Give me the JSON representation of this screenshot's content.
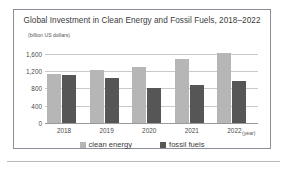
{
  "chart_data": {
    "type": "bar",
    "title": "Global Investment in Clean Energy and Fossil Fuels, 2018–2022",
    "xlabel": "(year)",
    "ylabel": "(billion US dollars)",
    "categories": [
      "2018",
      "2019",
      "2020",
      "2021",
      "2022"
    ],
    "series": [
      {
        "name": "clean energy",
        "color": "#b6b6b6",
        "values": [
          1130,
          1230,
          1290,
          1470,
          1620
        ]
      },
      {
        "name": "fossil fuels",
        "color": "#565656",
        "values": [
          1100,
          1050,
          810,
          880,
          980
        ]
      }
    ],
    "ylim": [
      0,
      1800
    ],
    "yticks": [
      0,
      400,
      800,
      1200,
      1600
    ],
    "ytick_labels": [
      "0",
      "400",
      "800",
      "1,200",
      "1,600"
    ],
    "grid": true,
    "legend_position": "bottom"
  }
}
